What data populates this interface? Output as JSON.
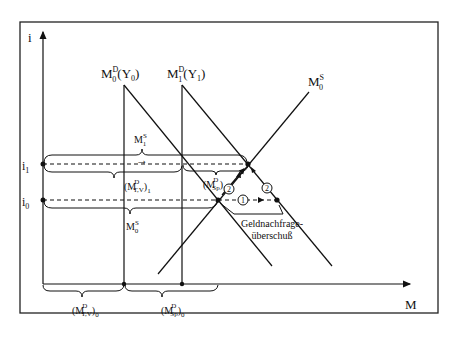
{
  "diagram": {
    "type": "money-market-diagram",
    "axes": {
      "y_label": "i",
      "x_label": "M",
      "y_ticks": [
        {
          "label": "i",
          "sub": "1",
          "name": "i1"
        },
        {
          "label": "i",
          "sub": "0",
          "name": "i0"
        }
      ]
    },
    "curves": {
      "money_demand_0": {
        "base": "M",
        "sup": "D",
        "sub": "0",
        "arg": "(Y",
        "arg_sub": "0",
        "arg_close": ")"
      },
      "money_demand_1": {
        "base": "M",
        "sup": "D",
        "sub": "1",
        "arg": "(Y",
        "arg_sub": "1",
        "arg_close": ")"
      },
      "money_supply_0": {
        "base": "M",
        "sup": "S",
        "sub": "0"
      }
    },
    "braces": {
      "m1_supply": {
        "base": "M",
        "sup": "S",
        "sub": "1"
      },
      "m0_supply": {
        "base": "M",
        "sup": "S",
        "sub": "0"
      },
      "mtv_1": {
        "open": "(M",
        "sup": "D",
        "sub": "T,V",
        "close": ")",
        "outer_sub": "1"
      },
      "msp_1": {
        "open": "(M",
        "sup": "D",
        "sub": "Sp",
        "close": ")",
        "outer_sub": "1"
      },
      "mtv_0": {
        "open": "(M",
        "sup": "D",
        "sub": "T,V",
        "close": ")",
        "outer_sub": "0"
      },
      "msp_0": {
        "open": "(M",
        "sup": "D",
        "sub": "Sp",
        "close": ")",
        "outer_sub": "0"
      }
    },
    "arrow_symbol": "→",
    "steps": [
      {
        "num": "1",
        "label": "step-1"
      },
      {
        "num": "2",
        "label": "step-2"
      },
      {
        "num": "2",
        "label": "step-2b"
      }
    ],
    "annotation": {
      "line1": "Geldnachfrage-",
      "line2": "überschuß"
    }
  }
}
